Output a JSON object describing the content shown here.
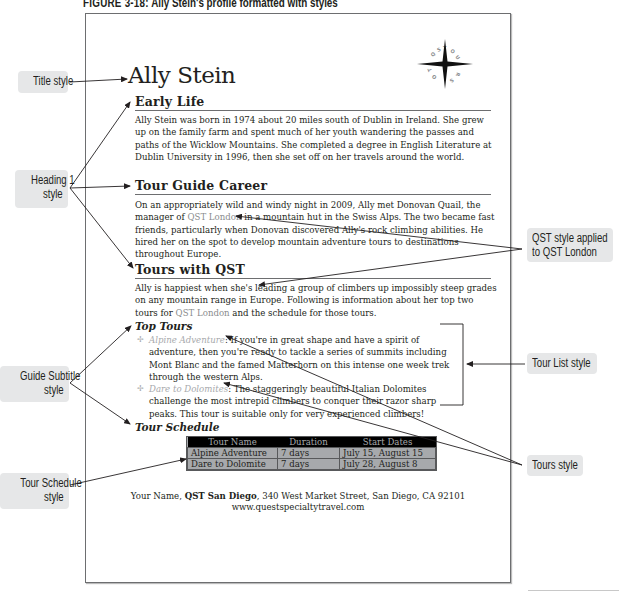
{
  "caption": {
    "figure_label": "FIGURE 3-18:",
    "text": "Ally Stein's profile formatted with styles"
  },
  "document": {
    "title": "Ally Stein",
    "logo": {
      "icon": "compass-star-icon",
      "letters": "QST TOURS"
    },
    "sections": [
      {
        "heading": "Early Life",
        "body": "Ally Stein was born in 1974 about 20 miles south of Dublin in Ireland. She grew up on the family farm and spent much of her youth wandering the passes and paths of the Wicklow Mountains. She completed a degree in English Literature at Dublin University in 1996, then she set off on her travels around the world."
      },
      {
        "heading": "Tour Guide Career",
        "body_before": "On an appropriately wild and windy night in 2009, Ally met Donovan Quail, the manager of ",
        "body_qst": "QST London",
        "body_after": " in a mountain hut in the Swiss Alps. The two became fast friends, particularly when Donovan discovered Ally's rock climbing abilities. He hired her on the spot to develop mountain adventure tours to destinations throughout Europe."
      },
      {
        "heading": "Tours with QST",
        "body_before": "Ally is happiest when she's leading a group of climbers up impossibly steep grades on any mountain range in Europe. Following is information about her top two tours for ",
        "body_qst": "QST London",
        "body_after": " and the schedule for those tours."
      }
    ],
    "top_tours": {
      "heading": "Top Tours",
      "bullet_icon": "compass-bullet-icon",
      "items": [
        {
          "name": "Alpine Adventure",
          "text": ": If you're in great shape and have a spirit of adventure, then you're ready to tackle a series of summits including Mont Blanc and the famed Matterhorn on this intense one week trek through the western Alps."
        },
        {
          "name": "Dare to Dolomites",
          "text": ": The staggeringly beautiful Italian Dolomites challenge the most intrepid climbers to conquer their razor sharp peaks. This tour is suitable only for very experienced climbers!"
        }
      ]
    },
    "tour_schedule": {
      "heading": "Tour Schedule",
      "columns": [
        "Tour Name",
        "Duration",
        "Start Dates"
      ],
      "rows": [
        [
          "Alpine Adventure",
          "7 days",
          "July 15, August 15"
        ],
        [
          "Dare to Dolomite",
          "7 days",
          "July 28, August 8"
        ]
      ]
    },
    "footer": {
      "name": "Your Name",
      "company": "QST San Diego",
      "address": ", 340 West Market Street, San Diego, CA 92101",
      "sep": ", ",
      "website": "www.questspecialtytravel.com"
    }
  },
  "callouts": {
    "title_style": "Title style",
    "heading1_line1": "Heading 1",
    "heading1_line2": "style",
    "guide_subtitle_line1": "Guide Subtitle",
    "guide_subtitle_line2": "style",
    "tour_schedule_line1": "Tour Schedule",
    "tour_schedule_line2": "style",
    "qst_line1": "QST style applied",
    "qst_line2": "to QST London",
    "tour_list": "Tour List style",
    "tours": "Tours style"
  },
  "colors": {
    "qst_text": "#8a8c8e",
    "table_header_bg": "#000000",
    "table_body_bg": "#a7a9ac",
    "callout_bg": "#e6e7e8"
  }
}
